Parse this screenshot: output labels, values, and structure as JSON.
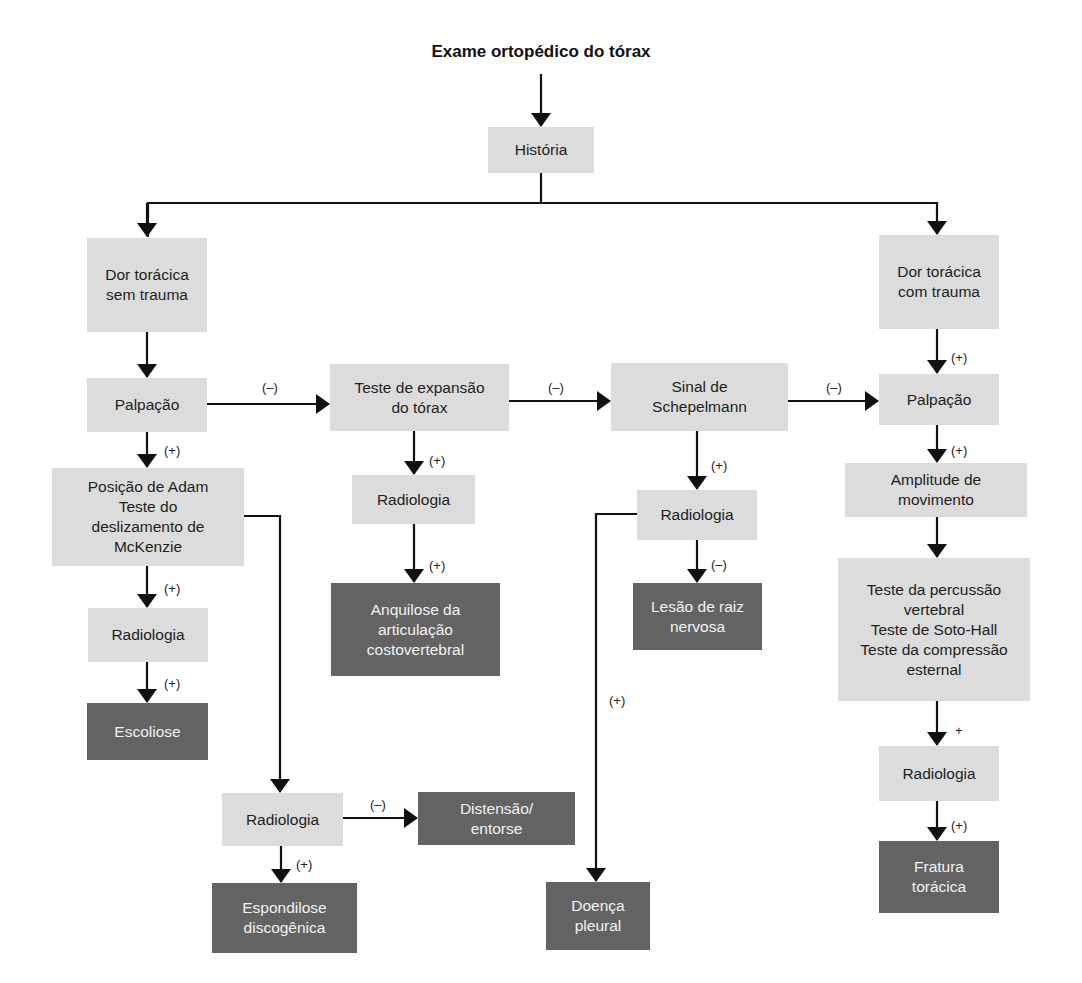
{
  "title": "Exame ortopédico do tórax",
  "colors": {
    "node_light": "#dcdcdc",
    "node_dark": "#636363",
    "line": "#111111"
  },
  "nodes": {
    "historia": "História",
    "dor_sem_trauma": "Dor torácica\nsem trauma",
    "palpacao_left": "Palpação",
    "adam_mckenzie": "Posição de Adam\nTeste do\ndeslizamento de\nMcKenzie",
    "radiologia_left1": "Radiologia",
    "escoliose": "Escoliose",
    "radiologia_left2": "Radiologia",
    "distensao": "Distensão/\nentorse",
    "espondilose": "Espondilose\ndiscogênica",
    "expansao": "Teste de expansão\ndo tórax",
    "radiologia_center1": "Radiologia",
    "anquilose": "Anquilose da\narticulação\ncostovertebral",
    "schepelmann": "Sinal de\nSchepelmann",
    "radiologia_center2": "Radiologia",
    "lesao_raiz": "Lesão de raiz\nnervosa",
    "doenca_pleural": "Doença\npleural",
    "dor_com_trauma": "Dor torácica\ncom trauma",
    "palpacao_right": "Palpação",
    "amplitude": "Amplitude de\nmovimento",
    "testes_percussao": "Teste da percussão\nvertebral\nTeste de Soto-Hall\nTeste da compressão\nesternal",
    "radiologia_right": "Radiologia",
    "fratura": "Fratura\ntorácica"
  },
  "edge_labels": {
    "palp_to_expansao": "(–)",
    "expansao_to_schep": "(–)",
    "schep_to_palp_right": "(–)",
    "palp_left_to_adam": "(+)",
    "adam_to_rad1": "(+)",
    "rad1_to_escoliose": "(+)",
    "rad2_to_distensao": "(–)",
    "rad2_to_espondilose": "(+)",
    "expansao_to_rad": "(+)",
    "rad_to_anquilose": "(+)",
    "schep_to_rad": "(+)",
    "rad_to_lesao": "(–)",
    "rad_to_pleural": "(+)",
    "trauma_to_palp": "(+)",
    "palp_to_amplitude": "(+)",
    "testes_to_rad": "+",
    "rad_to_fratura": "(+)"
  }
}
